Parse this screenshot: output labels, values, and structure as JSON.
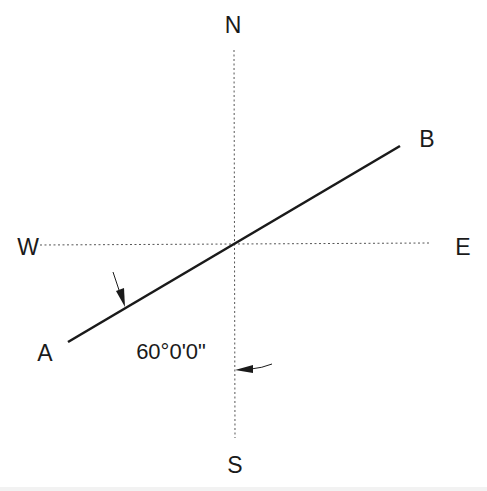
{
  "diagram": {
    "type": "bearing-compass",
    "colors": {
      "background": "#ffffff",
      "ink": "#1a1a1a",
      "axis": "#555555"
    },
    "compass": {
      "north_label": "N",
      "south_label": "S",
      "west_label": "W",
      "east_label": "E"
    },
    "line": {
      "start_label": "A",
      "end_label": "B"
    },
    "angle": {
      "value": "60°0'0\"",
      "degrees": 60,
      "minutes": 0,
      "seconds": 0,
      "measured_from": "S",
      "measured_to": "A"
    }
  }
}
